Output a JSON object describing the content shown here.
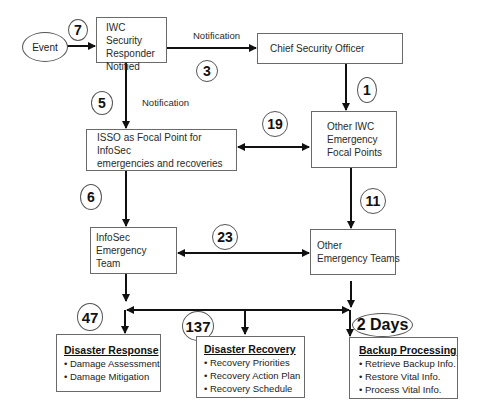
{
  "nodes": {
    "event": "Event",
    "responder": [
      "IWC Security",
      "Responder",
      "Notified"
    ],
    "cso": "Chief Security Officer",
    "isso": [
      "ISSO as Focal Point for InfoSec",
      "emergencies and recoveries"
    ],
    "other_iwc": [
      "Other IWC",
      "Emergency",
      "Focal Points"
    ],
    "infosec_team": [
      "InfoSec",
      "Emergency Team"
    ],
    "other_teams": [
      "Other",
      "Emergency Teams"
    ]
  },
  "edge_labels": {
    "responder_to_cso": "Notification",
    "responder_to_isso": "Notification"
  },
  "counts": {
    "event_to_responder": "7",
    "responder_to_cso": "3",
    "cso_to_other_iwc": "1",
    "responder_to_isso": "5",
    "isso_other_iwc": "19",
    "isso_to_infosec": "6",
    "other_iwc_to_teams": "11",
    "infosec_other_teams": "23",
    "disaster_response": "47",
    "disaster_recovery": "137",
    "backup_processing": "2 Days"
  },
  "outcomes": {
    "disaster_response": {
      "title": "Disaster Response",
      "items": [
        "Damage Assessment",
        "Damage Mitigation"
      ]
    },
    "disaster_recovery": {
      "title": "Disaster Recovery",
      "items": [
        "Recovery Priorities",
        "Recovery Action Plan",
        "Recovery Schedule"
      ]
    },
    "backup_processing": {
      "title": "Backup Processing",
      "items": [
        "Retrieve Backup Info.",
        "Restore Vital Info.",
        "Process Vital Info."
      ]
    }
  }
}
